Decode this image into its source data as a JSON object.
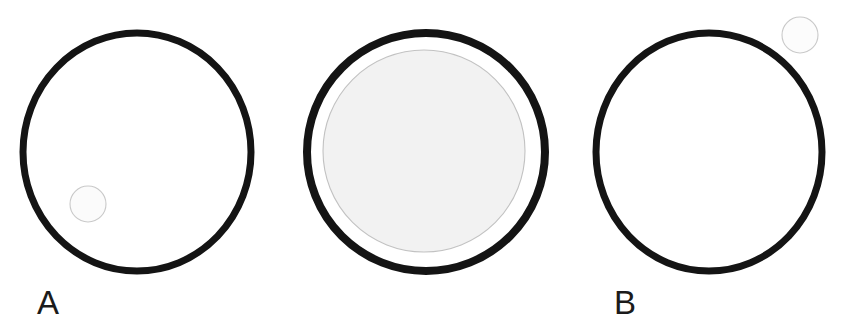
{
  "figure": {
    "width": 842,
    "height": 330,
    "background_color": "#ffffff"
  },
  "panels": [
    {
      "id": "a",
      "label": "A",
      "label_color": "#1b1b1b",
      "outline_color": "#141414",
      "outline_width": 7,
      "fill_color": "#ffffff",
      "center_x": 137,
      "center_y": 152,
      "radius_x": 114,
      "radius_y": 119,
      "inclusion": {
        "name": "small-circle",
        "center_x": 88,
        "center_y": 204,
        "radius": 18,
        "stroke_color": "#c9c9c9",
        "stroke_width": 1,
        "fill_color": "#fbfbfb",
        "position": "inside-lower-left"
      }
    },
    {
      "id": "b",
      "label": "B",
      "label_color": "#1b1b1b",
      "outline_color": "#141414",
      "outline_width": 8,
      "fill_color": "#ffffff",
      "center_x": 426,
      "center_y": 152,
      "radius_x": 119,
      "radius_y": 119,
      "inclusion": {
        "name": "large-inner-circle",
        "center_x": 424,
        "center_y": 151,
        "radius": 101,
        "stroke_color": "#c2c2c2",
        "stroke_width": 1,
        "fill_color": "#f2f2f2",
        "position": "inside-concentric"
      }
    },
    {
      "id": "c",
      "label": "C",
      "label_color": "#1b1b1b",
      "outline_color": "#141414",
      "outline_width": 7,
      "fill_color": "#ffffff",
      "center_x": 709,
      "center_y": 152,
      "radius_x": 113,
      "radius_y": 119,
      "inclusion": {
        "name": "small-circle",
        "center_x": 800,
        "center_y": 35,
        "radius": 18,
        "stroke_color": "#c9c9c9",
        "stroke_width": 1,
        "fill_color": "#fcfcfc",
        "position": "outside-upper-right"
      }
    }
  ]
}
